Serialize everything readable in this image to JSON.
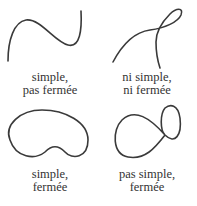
{
  "panels": [
    {
      "id": "top-left",
      "label_line1": "simple,",
      "label_line2": "pas fermée"
    },
    {
      "id": "top-right",
      "label_line1": "ni simple,",
      "label_line2": "ni fermée"
    },
    {
      "id": "bottom-left",
      "label_line1": "simple,",
      "label_line2": "fermée"
    },
    {
      "id": "bottom-right",
      "label_line1": "pas simple,",
      "label_line2": "fermée"
    }
  ],
  "colors": {
    "stroke": "#3a3a3a",
    "text": "#333333",
    "background": "#ffffff"
  }
}
